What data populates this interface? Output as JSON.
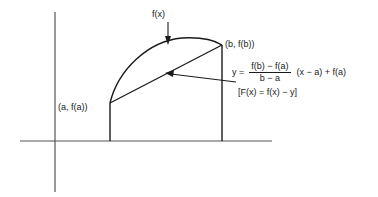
{
  "figure": {
    "background_color": "#ffffff",
    "stroke_color": "#1a1a1a",
    "axis_color": "#555555",
    "labels": {
      "curve_label": "f(x)",
      "point_b": "(b, f(b))",
      "point_a": "(a, f(a))",
      "difference": "[F(x) = f(x) − y]"
    },
    "equation": {
      "lhs": "y =",
      "numerator": "f(b) − f(a)",
      "denominator": "b − a",
      "tail": "(x − a) + f(a)"
    },
    "geometry": {
      "x_axis": {
        "x1": 20,
        "y1": 141,
        "x2": 272,
        "y2": 141
      },
      "y_axis": {
        "x1": 55,
        "y1": 12,
        "x2": 55,
        "y2": 192
      },
      "ordinate_a": {
        "x": 110,
        "y_top": 103,
        "y_bottom": 141
      },
      "ordinate_b": {
        "x": 222,
        "y_top": 45,
        "y_bottom": 141
      },
      "secant": {
        "x1": 110,
        "y1": 103,
        "x2": 222,
        "y2": 45
      },
      "curve": {
        "start_x": 110,
        "start_y": 103,
        "apex_x": 190,
        "apex_y": 38,
        "end_x": 222,
        "end_y": 45
      },
      "curve_arrow": {
        "x": 168,
        "y_from": 22,
        "y_to": 44
      },
      "secant_arrow": {
        "tip_x": 166,
        "tip_y": 73,
        "tail_x": 236,
        "tail_y": 82
      }
    }
  }
}
